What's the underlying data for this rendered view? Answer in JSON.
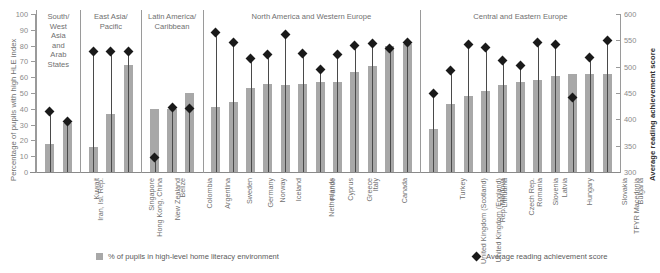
{
  "axes": {
    "left_title": "Percentage of pupils with high HLE index",
    "right_title": "Average reading achievement score",
    "left_ticks": [
      "100",
      "90",
      "80",
      "70",
      "60",
      "50",
      "40",
      "30",
      "20",
      "10",
      "0"
    ],
    "right_ticks": [
      "600",
      "550",
      "500",
      "450",
      "400",
      "350",
      "300"
    ]
  },
  "legend": {
    "bar_label": "% of pupils in high-level home literacy environment",
    "diamond_label": "Average reading achievement score"
  },
  "groups": [
    {
      "name": "South/\nWest\nAsia\nand\nArab\nStates",
      "count": 2
    },
    {
      "name": "East Asia/\nPacific",
      "count": 3
    },
    {
      "name": "Latin America/\nCaribbean",
      "count": 3
    },
    {
      "name": "North America and Western Europe",
      "count": 12
    },
    {
      "name": "Central and Eastern Europe",
      "count": 11
    }
  ],
  "chart_data": {
    "type": "bar",
    "title": "",
    "xlabel": "",
    "ylabel": "Percentage of pupils with high HLE index",
    "ylabel_right": "Average reading achievement score",
    "ylim": [
      0,
      100
    ],
    "ylim_right": [
      300,
      600
    ],
    "grid": false,
    "legend_position": "bottom",
    "categories": [
      "Iran, Isl. Rep.",
      "Kuwait",
      "Hong Kong, China",
      "Singapore",
      "New Zealand",
      "Belize",
      "Colombia",
      "Argentina",
      "Sweden",
      "Germany",
      "Norway",
      "Iceland",
      "Netherlands",
      "France",
      "Cyprus",
      "Greece",
      "Italy",
      "Canada",
      "United Kingdom (Scotland)",
      "United Kingdom (England)",
      "Turkey",
      "Rep. Moldova",
      "Lithuania",
      "Czech Rep.",
      "Romania",
      "Slovenia",
      "Latvia",
      "Hungary",
      "TFYR Macedonia",
      "Slovakia",
      "Bulgaria"
    ],
    "series": [
      {
        "name": "% of pupils in high-level home literacy environment",
        "type": "bar",
        "axis": "left",
        "values": [
          18,
          31,
          16,
          37,
          68,
          40,
          40,
          50,
          41,
          44,
          53,
          56,
          55,
          56,
          57,
          57,
          63,
          67,
          80,
          81,
          27,
          43,
          48,
          51,
          55,
          57,
          58,
          61,
          62,
          62,
          62
        ]
      },
      {
        "name": "Average reading achievement score",
        "type": "scatter",
        "axis": "right",
        "values": [
          414,
          396,
          528,
          528,
          528,
          327,
          422,
          420,
          564,
          546,
          516,
          524,
          562,
          525,
          494,
          524,
          541,
          544,
          535,
          546,
          449,
          492,
          543,
          537,
          512,
          502,
          545,
          543,
          442,
          518,
          550
        ]
      }
    ]
  }
}
